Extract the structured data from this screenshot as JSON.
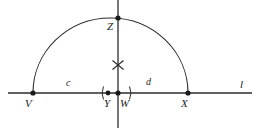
{
  "figure": {
    "type": "geometric-construction",
    "background_color": "#ffffff",
    "stroke_color": "#2b2b2b"
  },
  "line": {
    "name": "l",
    "label": "l",
    "y": 93,
    "x_start": 8,
    "x_end": 252
  },
  "points": [
    {
      "id": "V",
      "label": "V",
      "x": 33,
      "y": 93,
      "label_dx": -4,
      "label_dy": 5
    },
    {
      "id": "Y",
      "label": "Y",
      "x": 108,
      "y": 93,
      "label_dx": -3,
      "label_dy": 5
    },
    {
      "id": "W",
      "label": "W",
      "x": 118,
      "y": 93,
      "label_dx": 2,
      "label_dy": 5
    },
    {
      "id": "X",
      "label": "X",
      "x": 188,
      "y": 93,
      "label_dx": -4,
      "label_dy": 5
    },
    {
      "id": "Z",
      "label": "Z",
      "x": 118,
      "y": 18,
      "label_dx": -11,
      "label_dy": 3
    }
  ],
  "arc": {
    "name": "semicircle",
    "center_x": 110.5,
    "center_y": 93,
    "radius_x": 77.5,
    "radius_y": 75,
    "from_x": 33,
    "from_y": 93,
    "to_x": 188,
    "to_y": 93,
    "apex_x": 118,
    "apex_y": 18
  },
  "vertical_line": {
    "name": "perpendicular-through-W",
    "x": 118,
    "y_top": 0,
    "y_bottom": 128
  },
  "cross_mark": {
    "name": "x-mark",
    "label": "×",
    "x": 118,
    "y": 65,
    "size": 11
  },
  "segments": [
    {
      "id": "c",
      "label": "c",
      "from": "V",
      "to": "Y",
      "label_x": 68,
      "label_y": 84
    },
    {
      "id": "d",
      "label": "d",
      "from": "W",
      "to": "X",
      "label_x": 148,
      "label_y": 83
    }
  ],
  "tick_marks": [
    {
      "id": "left-paren",
      "glyph": "(",
      "x": 102,
      "y": 93
    },
    {
      "id": "right-paren",
      "glyph": ")",
      "x": 131,
      "y": 93
    }
  ]
}
